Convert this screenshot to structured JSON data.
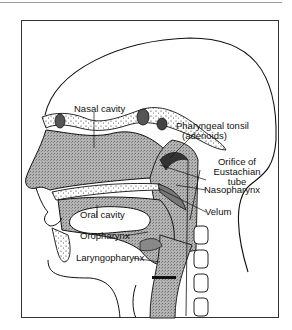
{
  "diagram": {
    "type": "sagittal-head-section",
    "labels": {
      "nasal_cavity": "Nasal cavity",
      "pharyngeal_tonsil_1": "Pharyngeal tonsil",
      "pharyngeal_tonsil_2": "(adenoids)",
      "orifice_1": "Orifice of",
      "orifice_2": "Eustachian",
      "orifice_3": "tube",
      "nasopharynx": "Nasopharynx",
      "velum": "Velum",
      "oral_cavity": "Oral cavity",
      "oropharynx": "Oropharynx",
      "laryngopharynx": "Laryngopharynx"
    },
    "colors": {
      "line": "#111111",
      "tissue_fill": "#a8a8a8",
      "cavity_fill": "#ffffff"
    }
  }
}
